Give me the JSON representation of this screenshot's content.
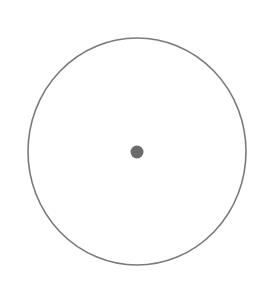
{
  "diagram": {
    "width": 269,
    "height": 284,
    "background": "#ffffff",
    "outer_circle": {
      "cx": 137,
      "cy": 151.5,
      "rx": 109,
      "ry": 113.5,
      "stroke": "#7a7a7a",
      "stroke_width": 1.6,
      "fill": "none"
    },
    "center_dot": {
      "cx": 137,
      "cy": 152,
      "r": 6.5,
      "fill": "#6b6b6b"
    }
  }
}
